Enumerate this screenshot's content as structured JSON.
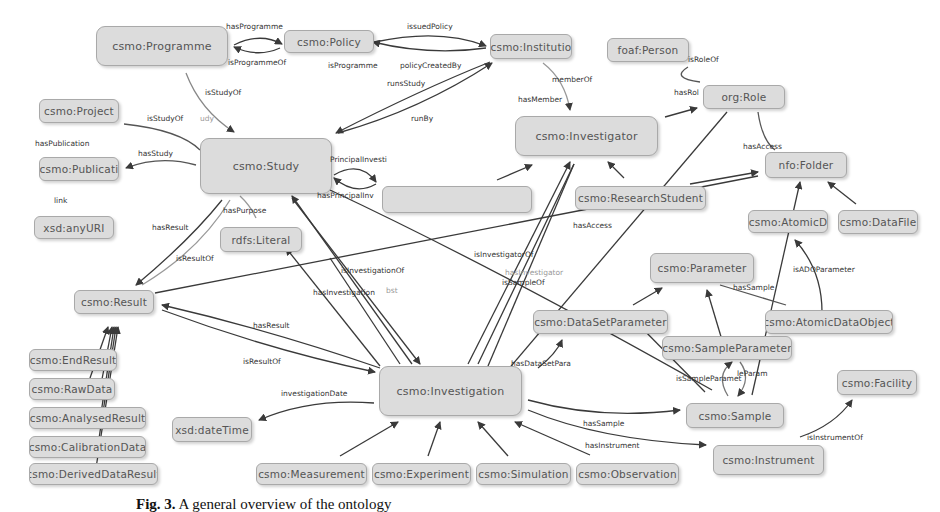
{
  "figure": {
    "caption_label": "Fig. 3.",
    "caption_text": "A general overview of the ontology"
  },
  "nodes": {
    "programme": "csmo:Programme",
    "policy": "csmo:Policy",
    "institution": "csmo:Institutio",
    "person": "foaf:Person",
    "role": "org:Role",
    "project": "csmo:Project",
    "publication": "csmo:Publicati",
    "anyuri": "xsd:anyURI",
    "study": "csmo:Study",
    "literal": "rdfs:Literal",
    "investigator": "csmo:Investigator",
    "principal_investigator": "csmo:PrincipleInvestigator",
    "research_student": "csmo:ResearchStudent",
    "folder": "nfo:Folder",
    "atomic_cd": "csmo:AtomicD",
    "datafile": "csmo:DataFile",
    "result": "csmo:Result",
    "parameter": "csmo:Parameter",
    "dataset_parameter": "csmo:DataSetParameter",
    "atomic_data_object": "csmo:AtomicDataObject",
    "sample_parameter": "csmo:SampleParameter",
    "end_result": "csmo:EndResult",
    "raw_data": "csmo:RawData",
    "analysed_result": "csmo:AnalysedResult",
    "calibration_data": "csmo:CalibrationData",
    "derived_data_result": "csmo:DerivedDataResult",
    "datetime": "xsd:dateTime",
    "investigation": "csmo:Investigation",
    "sample": "csmo:Sample",
    "facility": "csmo:Facility",
    "instrument": "csmo:Instrument",
    "measurement": "csmo:Measurement",
    "experiment": "csmo:Experiment",
    "simulation": "csmo:Simulation",
    "observation": "csmo:Observation"
  },
  "edge_labels": {
    "has_programme": "hasProgramme",
    "is_programme_of": "isProgrammeOf",
    "issued_policy": "issuedPolicy",
    "is_programme_2": "isProgramme",
    "policy_created_by": "policyCreatedBy",
    "runs_study": "runsStudy",
    "run_by": "runBy",
    "member_of": "memberOf",
    "has_member": "hasMember",
    "is_role_of": "isRoleOf",
    "has_role": "hasRol",
    "is_study_of_1": "isStudyOf",
    "is_study_of_2": "isStudyOf",
    "study_short": "udy",
    "has_publication": "hasPublication",
    "has_study": "hasStudy",
    "link": "link",
    "principal_investi": "PrincipalInvesti",
    "has_principal_inv": "hasPrincipalInv",
    "has_purpose": "hasPurpose",
    "has_result_1": "hasResult",
    "is_result_of_1": "isResultOf",
    "has_access_1": "hasAccess",
    "has_access_2": "hasAccess",
    "is_investigator_of": "isInvestigatorOf",
    "has_investigator": "hasInvestigator",
    "is_sample_of": "isSampleOf",
    "is_investigation_of": "isInvestigationOf",
    "has_investigation": "hasInvestigation",
    "bst": "bst",
    "is_add_parameter": "isADOParameter",
    "has_sample_1": "hasSample",
    "has_result_2": "hasResult",
    "is_result_of_2": "isResultOf",
    "has_dataset_para": "hasDataSetPara",
    "is_sample_paramet": "isSampleParamet",
    "le_param": "leParam",
    "investigation_date": "investigationDate",
    "has_sample_2": "hasSample",
    "has_instrument": "hasInstrument",
    "is_instrument_of": "isInstrumentOf"
  },
  "colors": {
    "node_fill": "#dcdcdc",
    "node_border": "#a9a9a9",
    "edge": "#3a3a3a",
    "edge_faint": "#bbbbbb",
    "text": "#555555"
  }
}
